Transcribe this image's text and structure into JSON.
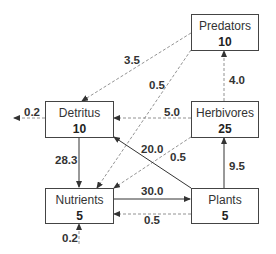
{
  "nodes": {
    "predators": {
      "name": "Predators",
      "value": "10"
    },
    "detritus": {
      "name": "Detritus",
      "value": "10"
    },
    "herbivores": {
      "name": "Herbivores",
      "value": "25"
    },
    "nutrients": {
      "name": "Nutrients",
      "value": "5"
    },
    "plants": {
      "name": "Plants",
      "value": "5"
    }
  },
  "flows": {
    "predators_to_detritus": "3.5",
    "predators_to_nutrients": "0.5",
    "herbivores_to_predators": "4.0",
    "herbivores_to_detritus": "5.0",
    "herbivores_to_nutrients": "0.5",
    "plants_to_detritus": "20.0",
    "plants_to_herbivores": "9.5",
    "detritus_to_nutrients": "28.3",
    "nutrients_to_plants": "30.0",
    "plants_to_nutrients": "0.5",
    "detritus_export": "0.2",
    "nutrients_import": "0.2"
  },
  "legend": {
    "solid": "major flow",
    "dashed": "minor flow"
  }
}
